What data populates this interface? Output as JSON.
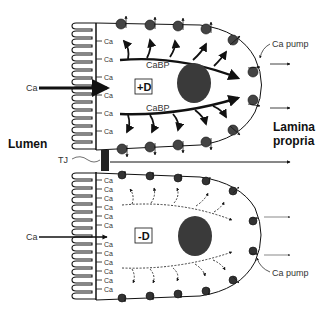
{
  "figure": {
    "labels": {
      "lumen": "Lumen",
      "lamina_propria_line1": "Lamina",
      "lamina_propria_line2": "propria",
      "tj": "TJ",
      "ca_left_top": "Ca",
      "ca_left_bottom": "Ca",
      "ca_pump_top": "Ca pump",
      "ca_pump_bottom": "Ca pump",
      "cabp_top": "CaBP",
      "cabp_bottom": "CaBP",
      "condition_top": "+D",
      "condition_bottom": "-D",
      "brush_border_ca": "Ca"
    },
    "cells": [
      {
        "id": "plus-d-cell",
        "condition": "+D",
        "ca_sites": 6,
        "cabp_style": "solid-bold",
        "pump_count": 12
      },
      {
        "id": "minus-d-cell",
        "condition": "-D",
        "ca_sites": 12,
        "cabp_style": "dashed-thin",
        "pump_count": 12
      }
    ],
    "colors": {
      "ink": "#111111",
      "nucleus": "#3a3a3a",
      "pump": "#444444",
      "tj": "#222222",
      "background": "#ffffff"
    }
  }
}
